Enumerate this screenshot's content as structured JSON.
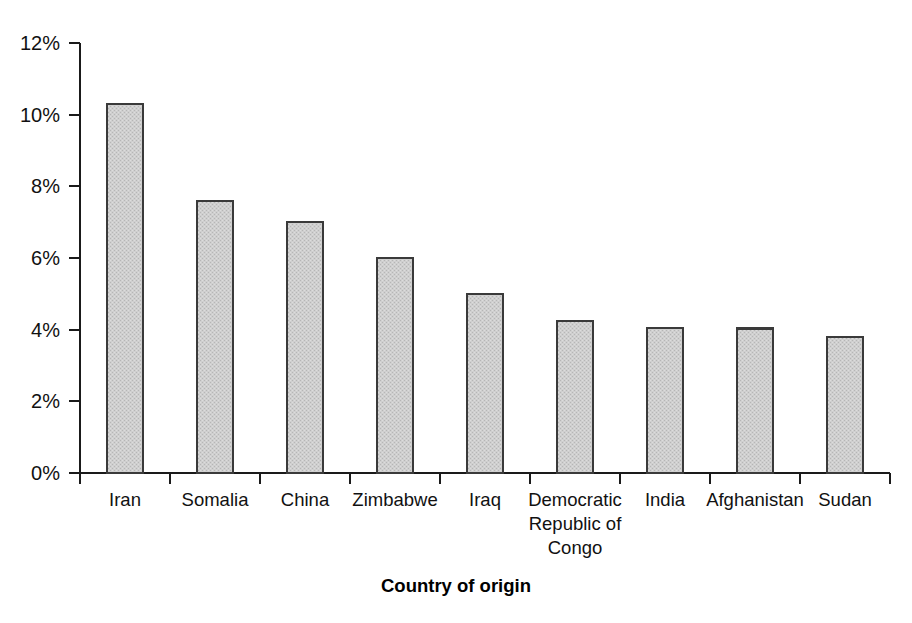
{
  "chart_data": {
    "type": "bar",
    "title": "",
    "subtitle": "",
    "xlabel": "Country of origin",
    "ylabel": "",
    "categories": [
      "Iran",
      "Somalia",
      "China",
      "Zimbabwe",
      "Iraq",
      "Democratic Republic of Congo",
      "India",
      "Afghanistan",
      "Sudan"
    ],
    "category_lines": [
      [
        "Iran"
      ],
      [
        "Somalia"
      ],
      [
        "China"
      ],
      [
        "Zimbabwe"
      ],
      [
        "Iraq"
      ],
      [
        "Democratic",
        "Republic of",
        "Congo"
      ],
      [
        "India"
      ],
      [
        "Afghanistan"
      ],
      [
        "Sudan"
      ]
    ],
    "values": [
      10.3,
      7.6,
      7.0,
      6.0,
      5.0,
      4.25,
      4.05,
      4.03,
      3.8
    ],
    "value_unit": "%",
    "ylim": [
      0,
      12
    ],
    "yticks": [
      0,
      2,
      4,
      6,
      8,
      10,
      12
    ],
    "ytick_labels": [
      "0%",
      "2%",
      "4%",
      "6%",
      "8%",
      "10%",
      "12%"
    ],
    "grid": false,
    "legend": null,
    "bar_fill_color": "#c9c9c9",
    "bar_border_color": "#3a3a3a",
    "axis_color": "#1a1a1a",
    "background_color": "#ffffff"
  }
}
